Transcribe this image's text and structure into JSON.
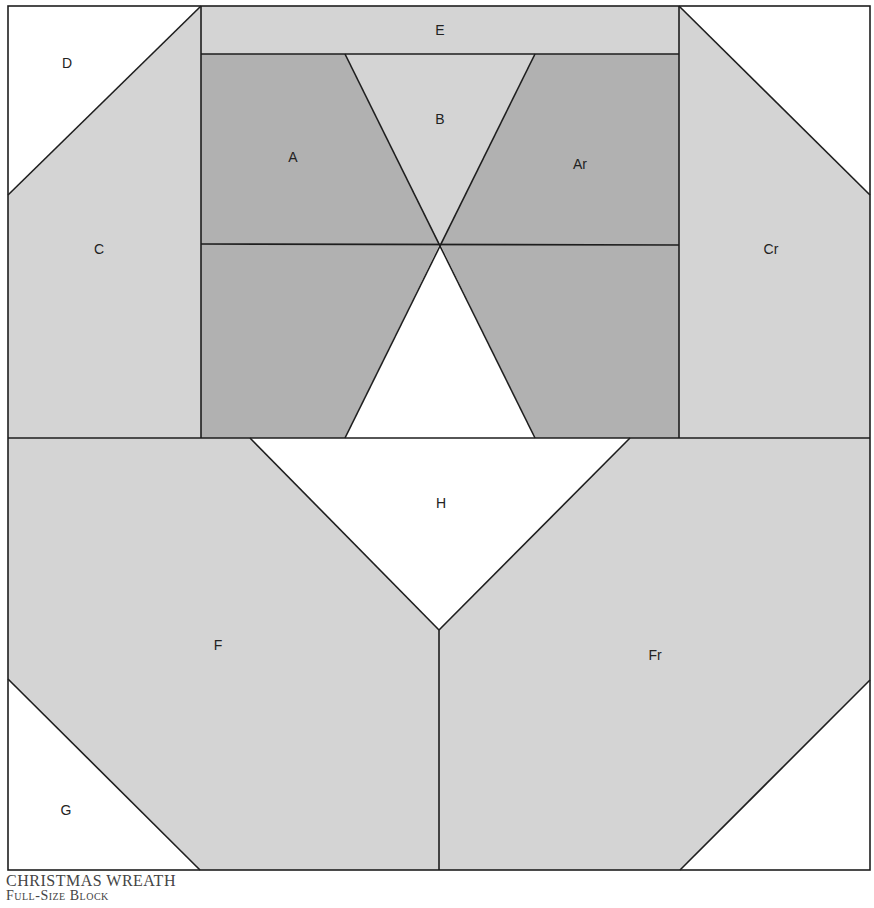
{
  "diagram": {
    "title": "CHRISTMAS WREATH",
    "subtitle": "Full-Size Block",
    "colors": {
      "dark": "#b1b1b1",
      "light": "#d4d4d4",
      "white": "#ffffff",
      "line": "#1e1e1e"
    },
    "pieces": {
      "A": "A",
      "Ar": "Ar",
      "B": "B",
      "C": "C",
      "Cr": "Cr",
      "D": "D",
      "E": "E",
      "F": "F",
      "Fr": "Fr",
      "G": "G",
      "H": "H"
    }
  }
}
